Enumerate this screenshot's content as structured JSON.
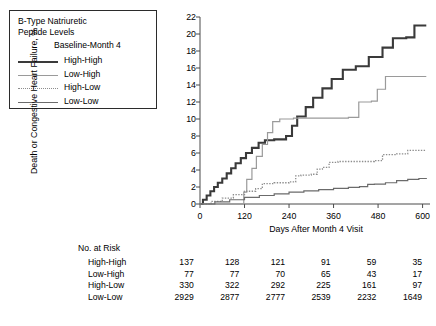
{
  "legend": {
    "title_line1": "B-Type Natriuretic",
    "title_line2": "Peptide Levels",
    "subtitle": "Baseline-Month 4",
    "items": [
      {
        "label": "High-High",
        "style": "solid-thick",
        "color": "#3a3a3a"
      },
      {
        "label": "Low-High",
        "style": "solid-thin",
        "color": "#9a9a9a"
      },
      {
        "label": "High-Low",
        "style": "dotted",
        "color": "#8d8d8d"
      },
      {
        "label": "Low-Low",
        "style": "solid-medium",
        "color": "#6b6b6b"
      }
    ]
  },
  "risk_table": {
    "title": "No. at Risk",
    "rows": [
      {
        "name": "High-High",
        "values": [
          "137",
          "128",
          "121",
          "91",
          "59",
          "35"
        ]
      },
      {
        "name": "Low-High",
        "values": [
          "77",
          "77",
          "70",
          "65",
          "43",
          "17"
        ]
      },
      {
        "name": "High-Low",
        "values": [
          "330",
          "322",
          "292",
          "225",
          "161",
          "97"
        ]
      },
      {
        "name": "Low-Low",
        "values": [
          "2929",
          "2877",
          "2777",
          "2539",
          "2232",
          "1649"
        ]
      }
    ]
  },
  "chart_data": {
    "type": "line",
    "title": "",
    "xlabel": "Days After Month 4 Visit",
    "ylabel": "Death or Congestive Heart Failure, %",
    "xlim": [
      0,
      620
    ],
    "ylim": [
      0,
      22
    ],
    "xticks": [
      0,
      120,
      240,
      360,
      480,
      600
    ],
    "xtick_labels": [
      "0",
      "120",
      "240",
      "360",
      "480",
      "600"
    ],
    "yticks": [
      0,
      2,
      4,
      6,
      8,
      10,
      12,
      14,
      16,
      18,
      20,
      22
    ],
    "ytick_labels": [
      "0",
      "2",
      "4",
      "6",
      "8",
      "10",
      "12",
      "14",
      "16",
      "18",
      "20",
      "22"
    ],
    "grid": false,
    "legend_position": "upper-left-outside",
    "series": [
      {
        "name": "High-High",
        "style": "step",
        "color": "#3a3a3a",
        "width": 2.1,
        "dash": "none",
        "points": [
          [
            0,
            0
          ],
          [
            8,
            0.5
          ],
          [
            18,
            1.0
          ],
          [
            28,
            1.5
          ],
          [
            38,
            2.0
          ],
          [
            48,
            2.5
          ],
          [
            60,
            3.0
          ],
          [
            72,
            3.6
          ],
          [
            84,
            4.2
          ],
          [
            96,
            4.8
          ],
          [
            110,
            5.4
          ],
          [
            124,
            6.0
          ],
          [
            140,
            6.6
          ],
          [
            158,
            7.2
          ],
          [
            175,
            7.5
          ],
          [
            200,
            7.6
          ],
          [
            232,
            8.0
          ],
          [
            248,
            9.2
          ],
          [
            262,
            10.3
          ],
          [
            285,
            11.4
          ],
          [
            305,
            12.5
          ],
          [
            330,
            13.6
          ],
          [
            355,
            14.7
          ],
          [
            385,
            15.8
          ],
          [
            420,
            16.2
          ],
          [
            455,
            17.3
          ],
          [
            492,
            18.4
          ],
          [
            520,
            19.5
          ],
          [
            556,
            19.6
          ],
          [
            578,
            21.0
          ],
          [
            610,
            21.0
          ]
        ]
      },
      {
        "name": "Low-High",
        "style": "step",
        "color": "#9a9a9a",
        "width": 1.2,
        "dash": "none",
        "points": [
          [
            0,
            0
          ],
          [
            110,
            0
          ],
          [
            118,
            1.4
          ],
          [
            126,
            2.9
          ],
          [
            140,
            4.2
          ],
          [
            152,
            5.6
          ],
          [
            168,
            7.0
          ],
          [
            182,
            8.4
          ],
          [
            196,
            9.7
          ],
          [
            215,
            10.0
          ],
          [
            252,
            10.1
          ],
          [
            300,
            10.1
          ],
          [
            360,
            10.1
          ],
          [
            400,
            10.2
          ],
          [
            428,
            12.0
          ],
          [
            462,
            12.1
          ],
          [
            478,
            13.5
          ],
          [
            500,
            15.0
          ],
          [
            540,
            15.0
          ],
          [
            610,
            15.0
          ]
        ]
      },
      {
        "name": "High-Low",
        "style": "step",
        "color": "#8d8d8d",
        "width": 1.3,
        "dash": "dotted",
        "points": [
          [
            0,
            0
          ],
          [
            30,
            0.3
          ],
          [
            60,
            0.7
          ],
          [
            90,
            1.1
          ],
          [
            120,
            1.5
          ],
          [
            150,
            1.8
          ],
          [
            168,
            2.4
          ],
          [
            200,
            2.5
          ],
          [
            240,
            2.6
          ],
          [
            258,
            3.3
          ],
          [
            272,
            3.4
          ],
          [
            300,
            3.5
          ],
          [
            316,
            4.1
          ],
          [
            330,
            4.3
          ],
          [
            348,
            4.9
          ],
          [
            372,
            5.0
          ],
          [
            400,
            5.0
          ],
          [
            440,
            5.0
          ],
          [
            470,
            5.1
          ],
          [
            492,
            5.8
          ],
          [
            530,
            5.9
          ],
          [
            560,
            6.3
          ],
          [
            600,
            6.3
          ],
          [
            610,
            6.3
          ]
        ]
      },
      {
        "name": "Low-Low",
        "style": "step",
        "color": "#6b6b6b",
        "width": 1.2,
        "dash": "none",
        "points": [
          [
            0,
            0
          ],
          [
            40,
            0.25
          ],
          [
            80,
            0.5
          ],
          [
            120,
            0.78
          ],
          [
            160,
            1.0
          ],
          [
            200,
            1.2
          ],
          [
            240,
            1.4
          ],
          [
            280,
            1.55
          ],
          [
            320,
            1.7
          ],
          [
            360,
            1.85
          ],
          [
            400,
            1.95
          ],
          [
            430,
            2.05
          ],
          [
            452,
            2.3
          ],
          [
            470,
            2.35
          ],
          [
            500,
            2.5
          ],
          [
            530,
            2.75
          ],
          [
            560,
            2.9
          ],
          [
            590,
            3.0
          ],
          [
            610,
            3.05
          ]
        ]
      }
    ]
  }
}
